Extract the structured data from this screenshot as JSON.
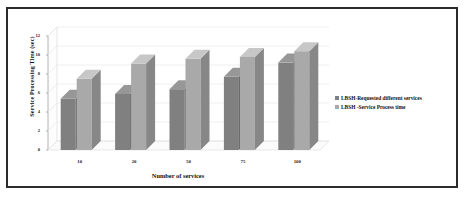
{
  "chart_data": {
    "type": "bar",
    "title": "",
    "subtitle": "",
    "xlabel": "Number of services",
    "ylabel": "Service Processing Time (sec)",
    "categories": [
      "10",
      "20",
      "50",
      "75",
      "100"
    ],
    "series": [
      {
        "name": "LBSH-Requested different services",
        "color": "#808080",
        "values": [
          5.4,
          5.9,
          6.4,
          7.7,
          9.2
        ]
      },
      {
        "name": "LBSH -Service  Process time",
        "color": "#a9a9a9",
        "values": [
          7.5,
          9.1,
          9.6,
          9.8,
          10.4
        ]
      }
    ],
    "ylim": [
      0,
      12
    ],
    "yticks": [
      "0",
      "2",
      "4",
      "6",
      "8",
      "10",
      "12"
    ],
    "grid": true,
    "legend_position": "right",
    "style": "3d-clustered-column",
    "annotations": []
  },
  "colors": {
    "series1": "#808080",
    "series2": "#a9a9a9",
    "frame_border": "#2b2b2b",
    "gridline": "#e2e2e5",
    "background": "#ffffff",
    "text": "#111111"
  }
}
